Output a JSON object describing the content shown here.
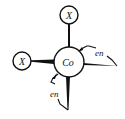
{
  "diagram": {
    "type": "coordination-complex-structure",
    "central_atom": {
      "label": "Co"
    },
    "ligands": [
      {
        "id": "x-top",
        "label": "X",
        "kind": "monodentate"
      },
      {
        "id": "x-left",
        "label": "X",
        "kind": "monodentate"
      },
      {
        "id": "en-right",
        "label": "en",
        "kind": "bidentate"
      },
      {
        "id": "en-bottom",
        "label": "en",
        "kind": "bidentate"
      }
    ],
    "colors": {
      "ink": "#111111",
      "background": "#ffffff"
    }
  }
}
